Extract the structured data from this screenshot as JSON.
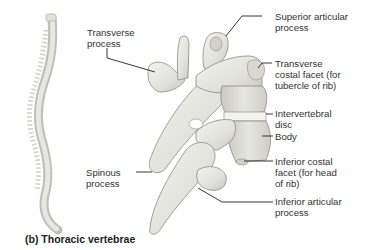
{
  "figure": {
    "caption": "(b) Thoracic vertebrae",
    "labels": {
      "transverse_process": "Transverse\nprocess",
      "superior_articular_process": "Superior articular\nprocess",
      "transverse_costal_facet": "Transverse\ncostal facet (for\ntubercle of rib)",
      "intervertebral_disc": "Intervertebral\ndisc",
      "body": "Body",
      "inferior_costal_facet": "Inferior costal\nfacet (for head\nof rib)",
      "spinous_process": "Spinous\nprocess",
      "inferior_articular_process": "Inferior articular\nprocess"
    },
    "colors": {
      "bone_fill": "#e9e9e4",
      "bone_shadow": "#b9b9b2",
      "outline": "#8a8a84",
      "leader_line": "#222222",
      "disc": "#f4f4ef"
    }
  }
}
